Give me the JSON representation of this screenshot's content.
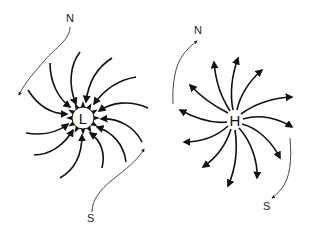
{
  "diagram": {
    "low": {
      "label": "L",
      "center": [
        83,
        118
      ],
      "rotation": "counterclockwise-inward",
      "north_label": "N",
      "south_label": "S"
    },
    "high": {
      "label": "H",
      "center": [
        235,
        120
      ],
      "rotation": "clockwise-outward",
      "north_label": "N",
      "south_label": "S"
    },
    "colors": {
      "ink": "#111111",
      "background": "#ffffff"
    }
  }
}
